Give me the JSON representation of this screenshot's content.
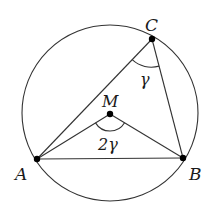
{
  "diagram": {
    "circle": {
      "center": [
        110,
        113
      ],
      "radius": 88
    },
    "points": {
      "A": {
        "label": "A",
        "x": 37,
        "y": 159
      },
      "B": {
        "label": "B",
        "x": 183,
        "y": 158
      },
      "C": {
        "label": "C",
        "x": 152,
        "y": 39
      },
      "M": {
        "label": "M",
        "x": 110,
        "y": 114
      }
    },
    "angles": {
      "inscribed": {
        "vertex": "C",
        "label": "γ"
      },
      "central": {
        "vertex": "M",
        "label": "2γ"
      }
    },
    "colors": {
      "stroke": "#333333",
      "point": "#000000",
      "background": "#ffffff"
    }
  }
}
